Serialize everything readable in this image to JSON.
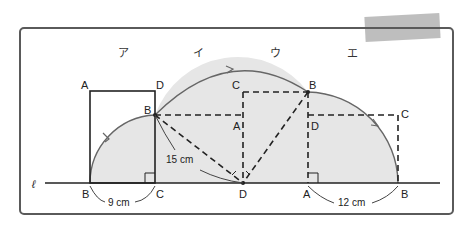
{
  "colors": {
    "frame": "#555555",
    "line": "#222222",
    "fill": "#e6e6e6",
    "arc": "#666666",
    "tape": "#a8a8a8"
  },
  "diagram": {
    "line_label": "ℓ",
    "stage_labels": [
      "ア",
      "イ",
      "ウ",
      "エ"
    ],
    "rect_a": {
      "A": "A",
      "D": "D",
      "B_top": "B",
      "B": "B",
      "C": "C"
    },
    "rect_b": {
      "C": "C",
      "B": "B",
      "A": "A",
      "D": "D"
    },
    "rect_c": {
      "B": "B",
      "D": "D",
      "C": "C",
      "A": "A",
      "B_end": "B"
    },
    "measures": {
      "bc": "9 cm",
      "diag": "15 cm",
      "ab": "12 cm"
    }
  }
}
